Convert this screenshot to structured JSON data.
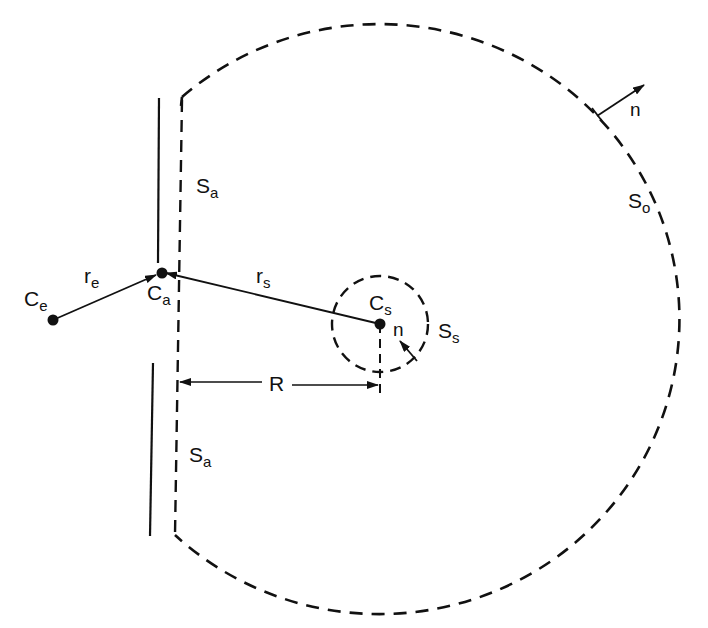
{
  "diagram": {
    "type": "geometry-schematic",
    "colors": {
      "ink": "#111111",
      "background": "#ffffff"
    },
    "points": {
      "C_e": {
        "label": "C",
        "sub": "e"
      },
      "C_a": {
        "label": "C",
        "sub": "a"
      },
      "C_s": {
        "label": "C",
        "sub": "s"
      }
    },
    "vectors": {
      "r_e": {
        "label": "r",
        "sub": "e"
      },
      "r_s": {
        "label": "r",
        "sub": "s"
      },
      "R": {
        "label": "R"
      },
      "n_outer": {
        "label": "n"
      },
      "n_inner": {
        "label": "n"
      }
    },
    "surfaces": {
      "S_a_upper": {
        "label": "S",
        "sub": "a"
      },
      "S_a_lower": {
        "label": "S",
        "sub": "a"
      },
      "S_o": {
        "label": "S",
        "sub": "o"
      },
      "S_s": {
        "label": "S",
        "sub": "s"
      }
    }
  }
}
